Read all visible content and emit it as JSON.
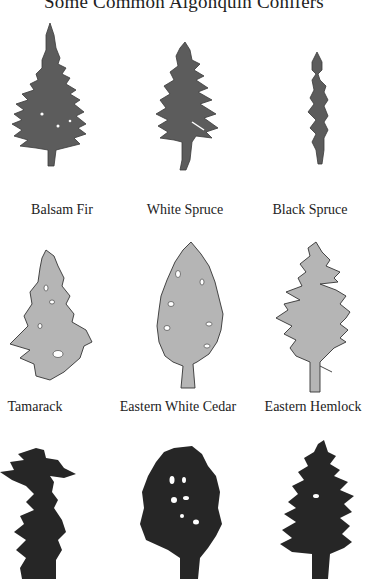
{
  "title": "Some Common Algonquin Conifers",
  "colors": {
    "dark_fill": "#5c5c5c",
    "light_fill": "#b5b5b5",
    "outline": "#333333",
    "black_fill": "#262626"
  },
  "trees": [
    {
      "label": "Balsam Fir",
      "fill": "dark"
    },
    {
      "label": "White Spruce",
      "fill": "dark"
    },
    {
      "label": "Black Spruce",
      "fill": "dark"
    },
    {
      "label": "Tamarack",
      "fill": "light"
    },
    {
      "label": "Eastern White Cedar",
      "fill": "light"
    },
    {
      "label": "Eastern Hemlock",
      "fill": "light"
    },
    {
      "label": "",
      "fill": "black"
    },
    {
      "label": "",
      "fill": "black"
    },
    {
      "label": "",
      "fill": "black"
    }
  ]
}
